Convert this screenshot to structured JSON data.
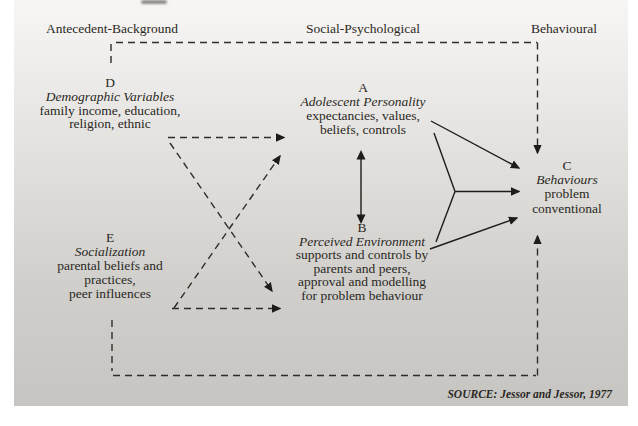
{
  "headers": {
    "antecedent": "Antecedent-Background",
    "social": "Social-Psychological",
    "behavioural": "Behavioural"
  },
  "blocks": {
    "d": {
      "letter": "D",
      "title": "Demographic Variables",
      "lines": [
        "family income, education,",
        "religion, ethnic"
      ]
    },
    "e": {
      "letter": "E",
      "title": "Socialization",
      "lines": [
        "parental beliefs and",
        "practices,",
        "peer influences"
      ]
    },
    "a": {
      "letter": "A",
      "title": "Adolescent Personality",
      "lines": [
        "expectancies, values,",
        "beliefs, controls"
      ]
    },
    "b": {
      "letter": "B",
      "title": "Perceived Environment",
      "lines": [
        "supports and controls by",
        "parents and peers,",
        "approval and modelling",
        "for problem behaviour"
      ]
    },
    "c": {
      "letter": "C",
      "title": "Behaviours",
      "lines": [
        "problem",
        "conventional"
      ]
    }
  },
  "source": "SOURCE: Jessor and Jessor, 1977",
  "edges": {
    "dashed": [
      "D to A",
      "D to B",
      "E to A",
      "E to B",
      "background loop into C (top)",
      "background loop into C (bottom)"
    ],
    "solid": [
      "A to C",
      "B to C",
      "A plus B joint fork to C",
      "A double-arrow B"
    ]
  },
  "colors": {
    "background_top": "#f7f6f4",
    "background_bottom": "#c6c5c2",
    "text": "#2b2823",
    "dashed_line": "#2f2d29",
    "solid_line": "#1e1c18"
  }
}
